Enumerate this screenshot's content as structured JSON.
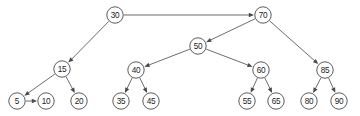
{
  "diagram": {
    "kind": "binary-search-tree",
    "title": "",
    "canvas": {
      "width": 360,
      "height": 116,
      "background": "#ffffff"
    },
    "style": {
      "node_stroke": "#4a4a4a",
      "node_fill": "#ffffff",
      "edge_stroke": "#5c5c5c",
      "label_color": "#1a1a1a",
      "node_radius": 8.2
    },
    "nodes": [
      {
        "id": "n30",
        "label": "30",
        "x": 115,
        "y": 15
      },
      {
        "id": "n70",
        "label": "70",
        "x": 263,
        "y": 15
      },
      {
        "id": "n50",
        "label": "50",
        "x": 198,
        "y": 46
      },
      {
        "id": "n15",
        "label": "15",
        "x": 62,
        "y": 69
      },
      {
        "id": "n40",
        "label": "40",
        "x": 136,
        "y": 70
      },
      {
        "id": "n60",
        "label": "60",
        "x": 261,
        "y": 70
      },
      {
        "id": "n85",
        "label": "85",
        "x": 325,
        "y": 70
      },
      {
        "id": "n5",
        "label": "5",
        "x": 17,
        "y": 101
      },
      {
        "id": "n10",
        "label": "10",
        "x": 46,
        "y": 101
      },
      {
        "id": "n20",
        "label": "20",
        "x": 79,
        "y": 101
      },
      {
        "id": "n35",
        "label": "35",
        "x": 121,
        "y": 101
      },
      {
        "id": "n45",
        "label": "45",
        "x": 151,
        "y": 101
      },
      {
        "id": "n55",
        "label": "55",
        "x": 247,
        "y": 101
      },
      {
        "id": "n65",
        "label": "65",
        "x": 276,
        "y": 101
      },
      {
        "id": "n80",
        "label": "80",
        "x": 309,
        "y": 101
      },
      {
        "id": "n90",
        "label": "90",
        "x": 339,
        "y": 101
      }
    ],
    "edges": [
      {
        "from": "n30",
        "to": "n70",
        "arrow": true
      },
      {
        "from": "n30",
        "to": "n15",
        "arrow": true
      },
      {
        "from": "n70",
        "to": "n50",
        "arrow": true
      },
      {
        "from": "n70",
        "to": "n85",
        "arrow": true
      },
      {
        "from": "n50",
        "to": "n40",
        "arrow": true
      },
      {
        "from": "n50",
        "to": "n60",
        "arrow": true
      },
      {
        "from": "n15",
        "to": "n5",
        "arrow": true
      },
      {
        "from": "n15",
        "to": "n20",
        "arrow": true
      },
      {
        "from": "n5",
        "to": "n10",
        "arrow": true
      },
      {
        "from": "n40",
        "to": "n35",
        "arrow": true
      },
      {
        "from": "n40",
        "to": "n45",
        "arrow": true
      },
      {
        "from": "n60",
        "to": "n55",
        "arrow": true
      },
      {
        "from": "n60",
        "to": "n65",
        "arrow": true
      },
      {
        "from": "n85",
        "to": "n80",
        "arrow": true
      },
      {
        "from": "n85",
        "to": "n90",
        "arrow": true
      }
    ]
  }
}
